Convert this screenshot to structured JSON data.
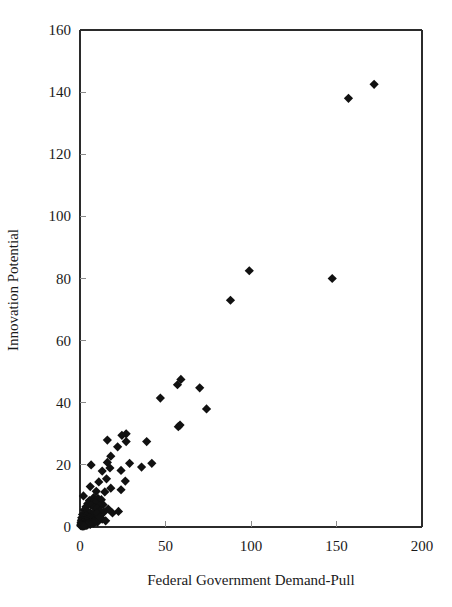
{
  "chart_data": {
    "type": "scatter",
    "title": "",
    "xlabel": "Federal Government Demand-Pull",
    "ylabel": "Innovation Potential",
    "xlim": [
      0,
      200
    ],
    "ylim": [
      0,
      160
    ],
    "xticks": [
      0,
      50,
      100,
      150,
      200
    ],
    "yticks": [
      0,
      20,
      40,
      60,
      80,
      100,
      120,
      140,
      160
    ],
    "xtick_labels": [
      "0",
      "50",
      "100",
      "150",
      "200"
    ],
    "ytick_labels": [
      "0",
      "20",
      "40",
      "60",
      "80",
      "100",
      "120",
      "140",
      "160"
    ],
    "grid": false,
    "legend": null,
    "marker": "diamond",
    "marker_color": "#111111",
    "marker_size": 7,
    "series": [
      {
        "name": "Observations",
        "points": [
          [
            172,
            142.5
          ],
          [
            157,
            138
          ],
          [
            147.5,
            80
          ],
          [
            99,
            82.5
          ],
          [
            88,
            73
          ],
          [
            59,
            47.5
          ],
          [
            57,
            45.8
          ],
          [
            70,
            44.8
          ],
          [
            47,
            41.5
          ],
          [
            74,
            38
          ],
          [
            57.5,
            32.3
          ],
          [
            58.5,
            32.8
          ],
          [
            27,
            30
          ],
          [
            24.5,
            29.5
          ],
          [
            16,
            28
          ],
          [
            39,
            27.5
          ],
          [
            27,
            27.5
          ],
          [
            22,
            25.8
          ],
          [
            18,
            22.8
          ],
          [
            6.5,
            20
          ],
          [
            16,
            20.8
          ],
          [
            29,
            20.5
          ],
          [
            42,
            20.5
          ],
          [
            36,
            19.3
          ],
          [
            17.5,
            19
          ],
          [
            24,
            18.2
          ],
          [
            13,
            18
          ],
          [
            15.5,
            15.5
          ],
          [
            26.5,
            14.8
          ],
          [
            11,
            14.5
          ],
          [
            18,
            12.5
          ],
          [
            24,
            12
          ],
          [
            6,
            13
          ],
          [
            9.5,
            11.5
          ],
          [
            14.5,
            11.3
          ],
          [
            2,
            10
          ],
          [
            8,
            9.5
          ],
          [
            10.5,
            9.2
          ],
          [
            12.5,
            8.8
          ],
          [
            5.5,
            8.5
          ],
          [
            7.5,
            8
          ],
          [
            9,
            7.8
          ],
          [
            13.5,
            7.2
          ],
          [
            11.5,
            6.8
          ],
          [
            4.5,
            7.5
          ],
          [
            6.5,
            7
          ],
          [
            3.5,
            6.5
          ],
          [
            8.5,
            6.2
          ],
          [
            10,
            6
          ],
          [
            16.5,
            5.8
          ],
          [
            22.5,
            5
          ],
          [
            19,
            4.5
          ],
          [
            14,
            4.8
          ],
          [
            12,
            5.2
          ],
          [
            2.5,
            5.5
          ],
          [
            4,
            5
          ],
          [
            5,
            4.8
          ],
          [
            6,
            4.5
          ],
          [
            7,
            4.2
          ],
          [
            8,
            4
          ],
          [
            9,
            3.8
          ],
          [
            10.5,
            3.6
          ],
          [
            3,
            4.2
          ],
          [
            1.5,
            4
          ],
          [
            2,
            3.5
          ],
          [
            3.5,
            3.4
          ],
          [
            4.5,
            3.2
          ],
          [
            5.5,
            3
          ],
          [
            6.5,
            2.9
          ],
          [
            7.5,
            2.8
          ],
          [
            8.5,
            2.6
          ],
          [
            9.5,
            2.5
          ],
          [
            11,
            2.4
          ],
          [
            1,
            3
          ],
          [
            1.8,
            2.8
          ],
          [
            2.6,
            2.6
          ],
          [
            3.4,
            2.4
          ],
          [
            4.2,
            2.3
          ],
          [
            5,
            2.2
          ],
          [
            5.8,
            2.1
          ],
          [
            6.6,
            2
          ],
          [
            7.4,
            1.9
          ],
          [
            8.2,
            1.8
          ],
          [
            9.2,
            1.7
          ],
          [
            10.2,
            1.6
          ],
          [
            0.8,
            2.2
          ],
          [
            1.5,
            2
          ],
          [
            2.2,
            1.9
          ],
          [
            3,
            1.8
          ],
          [
            3.8,
            1.7
          ],
          [
            4.6,
            1.6
          ],
          [
            5.4,
            1.5
          ],
          [
            6.2,
            1.4
          ],
          [
            7,
            1.3
          ],
          [
            8,
            1.2
          ],
          [
            0.6,
            1.5
          ],
          [
            1.3,
            1.4
          ],
          [
            2,
            1.3
          ],
          [
            2.8,
            1.2
          ],
          [
            3.6,
            1.1
          ],
          [
            4.4,
            1
          ],
          [
            5.2,
            0.9
          ],
          [
            6,
            0.8
          ],
          [
            0.5,
            0.9
          ],
          [
            1.1,
            0.8
          ],
          [
            1.8,
            0.7
          ],
          [
            2.5,
            0.6
          ],
          [
            3.2,
            0.5
          ],
          [
            4,
            0.5
          ],
          [
            0.4,
            0.4
          ],
          [
            1,
            0.35
          ],
          [
            1.6,
            0.3
          ],
          [
            2.3,
            0.3
          ],
          [
            13,
            2.5
          ],
          [
            15,
            2
          ],
          [
            12,
            3
          ],
          [
            10,
            4.5
          ],
          [
            11.5,
            3.2
          ]
        ]
      }
    ]
  }
}
